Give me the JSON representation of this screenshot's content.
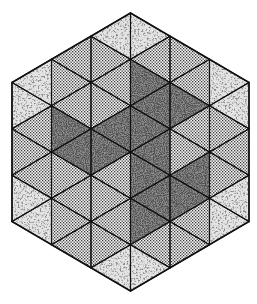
{
  "figure": {
    "width": 257,
    "height": 304,
    "background": "#ffffff",
    "stroke_color": "#111111",
    "grid": {
      "column_lines_x": [
        12,
        51.5,
        91,
        130.5,
        170,
        209.5,
        249
      ],
      "triangle_height": 46.33,
      "center_x": 130.5,
      "top_y": 13,
      "bottom_y": 291
    },
    "hexagon_vertices": [
      [
        130.5,
        13
      ],
      [
        249,
        82.5
      ],
      [
        249,
        221.5
      ],
      [
        130.5,
        291
      ],
      [
        12,
        221.5
      ],
      [
        12,
        82.5
      ]
    ],
    "shadings": {
      "coarse": {
        "label": "coarse light stipple",
        "base": "#e2e2e2",
        "ink": "#555555"
      },
      "dots": {
        "label": "fine dot screen",
        "base": "#f2f2f2",
        "ink": "#3a3a3a"
      },
      "dark": {
        "label": "dense dark stipple",
        "base": "#8a8a8a",
        "ink": "#1a1a1a"
      }
    },
    "columns": [
      {
        "col": 0,
        "triangles": [
          [
            "R",
            59.3,
            "coarse"
          ],
          [
            "L",
            82.5,
            "coarse"
          ],
          [
            "R",
            105.7,
            "dots"
          ],
          [
            "L",
            128.8,
            "dots"
          ],
          [
            "R",
            152.0,
            "dots"
          ],
          [
            "L",
            175.2,
            "coarse"
          ],
          [
            "R",
            198.3,
            "coarse"
          ]
        ]
      },
      {
        "col": 1,
        "triangles": [
          [
            "R",
            36.2,
            "dots"
          ],
          [
            "L",
            59.3,
            "dots"
          ],
          [
            "R",
            82.5,
            "dots"
          ],
          [
            "L",
            105.7,
            "dark"
          ],
          [
            "R",
            128.8,
            "dark"
          ],
          [
            "L",
            152.0,
            "dots"
          ],
          [
            "R",
            175.2,
            "dots"
          ],
          [
            "L",
            198.3,
            "dots"
          ],
          [
            "R",
            221.5,
            "dots"
          ]
        ]
      },
      {
        "col": 2,
        "triangles": [
          [
            "R",
            13.0,
            "coarse"
          ],
          [
            "L",
            36.2,
            "dots"
          ],
          [
            "R",
            59.3,
            "dots"
          ],
          [
            "L",
            82.5,
            "dots"
          ],
          [
            "R",
            105.7,
            "dark"
          ],
          [
            "L",
            128.8,
            "dark"
          ],
          [
            "R",
            152.0,
            "dots"
          ],
          [
            "L",
            175.2,
            "dots"
          ],
          [
            "R",
            198.3,
            "dots"
          ],
          [
            "L",
            221.5,
            "dots"
          ],
          [
            "R",
            244.7,
            "coarse"
          ]
        ]
      },
      {
        "col": 3,
        "triangles": [
          [
            "L",
            13.0,
            "coarse"
          ],
          [
            "R",
            36.2,
            "dots"
          ],
          [
            "L",
            59.3,
            "dark"
          ],
          [
            "R",
            82.5,
            "dark"
          ],
          [
            "L",
            105.7,
            "dark"
          ],
          [
            "R",
            128.8,
            "dark"
          ],
          [
            "L",
            152.0,
            "dark"
          ],
          [
            "R",
            175.2,
            "dark"
          ],
          [
            "L",
            198.3,
            "dark"
          ],
          [
            "R",
            221.5,
            "dots"
          ],
          [
            "L",
            244.7,
            "coarse"
          ]
        ]
      },
      {
        "col": 4,
        "triangles": [
          [
            "L",
            36.2,
            "dots"
          ],
          [
            "R",
            59.3,
            "dots"
          ],
          [
            "L",
            82.5,
            "dark"
          ],
          [
            "R",
            105.7,
            "dots"
          ],
          [
            "L",
            128.8,
            "dots"
          ],
          [
            "R",
            152.0,
            "dark"
          ],
          [
            "L",
            175.2,
            "dark"
          ],
          [
            "R",
            198.3,
            "dots"
          ],
          [
            "L",
            221.5,
            "dots"
          ]
        ]
      },
      {
        "col": 5,
        "triangles": [
          [
            "L",
            59.3,
            "coarse"
          ],
          [
            "R",
            82.5,
            "coarse"
          ],
          [
            "L",
            105.7,
            "dots"
          ],
          [
            "R",
            128.8,
            "dots"
          ],
          [
            "L",
            152.0,
            "dots"
          ],
          [
            "R",
            175.2,
            "coarse"
          ],
          [
            "L",
            198.3,
            "coarse"
          ]
        ]
      }
    ],
    "counts": {
      "total_triangles": 54,
      "coarse": 16,
      "dots": 24,
      "dark": 14
    }
  }
}
